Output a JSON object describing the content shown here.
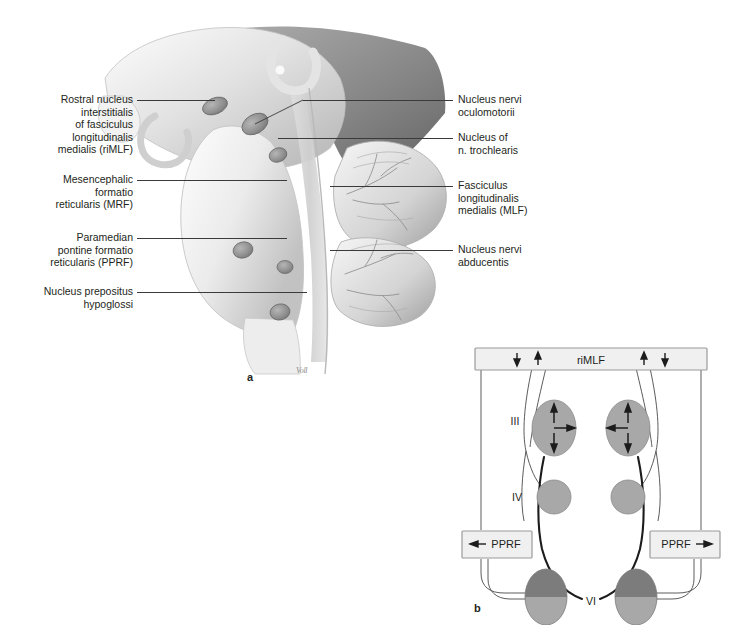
{
  "figure": {
    "panel_a": {
      "letter": "a",
      "signature": "Voll",
      "labels_left": [
        {
          "id": "rimlf",
          "text": "Rostral nucleus\ninterstitialis\nof fasciculus\nlongitudinalis\nmedialis (riMLF)"
        },
        {
          "id": "mrf",
          "text": "Mesencephalic\nformatio\nreticularis (MRF)"
        },
        {
          "id": "pprf",
          "text": "Paramedian\npontine formatio\nreticularis (PPRF)"
        },
        {
          "id": "prepositus",
          "text": "Nucleus prepositus\nhypoglossi"
        }
      ],
      "labels_right": [
        {
          "id": "oculomotorii",
          "text": "Nucleus nervi\noculomotorii"
        },
        {
          "id": "trochlearis",
          "text": "Nucleus of\nn. trochlearis"
        },
        {
          "id": "mlf",
          "text": "Fasciculus\nlongitudinalis\nmedialis (MLF)"
        },
        {
          "id": "abducentis",
          "text": "Nucleus nervi\nabducentis"
        }
      ]
    },
    "panel_b": {
      "letter": "b",
      "rimlf_bar": {
        "label": "riMLF",
        "arrow_left_outer": "↓",
        "arrow_left_inner": "↑",
        "arrow_right_inner": "↑",
        "arrow_right_outer": "↓"
      },
      "nuclei": [
        {
          "id": "iii",
          "label": "III"
        },
        {
          "id": "iv",
          "label": "IV"
        },
        {
          "id": "vi",
          "label": "VI"
        }
      ],
      "iii_left_arrows": {
        "up": "↑",
        "horizontal": "→",
        "down": "↓"
      },
      "iii_right_arrows": {
        "up": "↑",
        "horizontal": "←",
        "down": "↓"
      },
      "pprf_left": {
        "arrow": "←",
        "label": "PPRF"
      },
      "pprf_right": {
        "label": "PPRF",
        "arrow": "→"
      }
    }
  },
  "colors": {
    "ink": "#231f20",
    "leader": "#3a3a3a",
    "nucleus_gray": "#a8a8a8",
    "nucleus_dark": "#7c7c7c",
    "box_fill": "#f0f0f0",
    "box_stroke": "#9a9a9a",
    "tissue_light": "#efefef",
    "tissue_mid": "#c9c9c9",
    "tissue_dark": "#8e8e8e"
  }
}
